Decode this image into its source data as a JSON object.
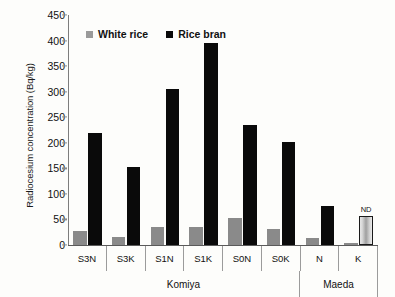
{
  "chart_data": {
    "type": "bar",
    "title": "",
    "xlabel": "",
    "ylabel": "Radiocesium concentration (Bq/kg)",
    "ylim": [
      0,
      450
    ],
    "ytick_step": 50,
    "yticks": [
      450,
      400,
      350,
      300,
      250,
      200,
      150,
      100,
      50,
      0
    ],
    "grid": false,
    "legend_position": "top-left-inside",
    "categories": [
      "S3N",
      "S3K",
      "S1N",
      "S1K",
      "S0N",
      "S0K",
      "N",
      "K"
    ],
    "groups": [
      {
        "label": "Komiya",
        "categories": [
          "S3N",
          "S3K",
          "S1N",
          "S1K",
          "S0N",
          "S0K"
        ]
      },
      {
        "label": "Maeda",
        "categories": [
          "N",
          "K"
        ]
      }
    ],
    "series": [
      {
        "name": "White rice",
        "color": "#8a8a8a",
        "values": [
          27,
          15,
          36,
          36,
          52,
          32,
          13,
          4
        ]
      },
      {
        "name": "Rice bran",
        "color": "#0a0a0a",
        "values": [
          220,
          153,
          305,
          395,
          235,
          202,
          77,
          57
        ]
      }
    ],
    "annotations": [
      {
        "text": "ND",
        "category": "K",
        "series": "Rice bran",
        "value": 57
      }
    ],
    "special_bars": [
      {
        "category": "K",
        "series": "Rice bran",
        "style": "outlined-gradient",
        "note": "ND"
      }
    ]
  },
  "legend": {
    "entries": [
      {
        "label": "White rice",
        "swatch": "gray-square"
      },
      {
        "label": "Rice bran",
        "swatch": "black-square"
      }
    ]
  },
  "axis": {
    "y_title": "Radiocesium concentration (Bq/kg)"
  }
}
